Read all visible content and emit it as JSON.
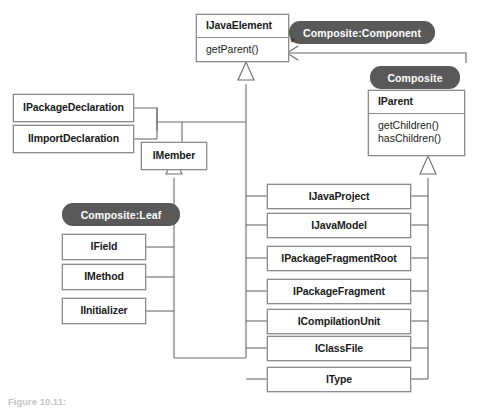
{
  "diagram": {
    "kind": "uml-class-diagram",
    "width": 488,
    "height": 408,
    "colors": {
      "badge_fill": "#595959",
      "badge_text": "#ffffff",
      "box_fill": "#ffffff",
      "box_border": "#8c8c8c",
      "line": "#6b6b6b",
      "text": "#1a1a1a",
      "background": "#ffffff"
    }
  },
  "classes": {
    "ijavaelement": {
      "name": "IJavaElement",
      "operations": "getParent()"
    },
    "iparent": {
      "name": "IParent",
      "operations_1": "getChildren()",
      "operations_2": "hasChildren()"
    },
    "ipackagedeclaration": {
      "name": "IPackageDeclaration"
    },
    "iimportdeclaration": {
      "name": "IImportDeclaration"
    },
    "imember": {
      "name": "IMember"
    },
    "ifield": {
      "name": "IField"
    },
    "imethod": {
      "name": "IMethod"
    },
    "iinitializer": {
      "name": "IInitializer"
    },
    "ijavaproject": {
      "name": "IJavaProject"
    },
    "ijavamodel": {
      "name": "IJavaModel"
    },
    "ipackagefragmentroot": {
      "name": "IPackageFragmentRoot"
    },
    "ipackagefragment": {
      "name": "IPackageFragment"
    },
    "icompilationunit": {
      "name": "ICompilationUnit"
    },
    "iclassfile": {
      "name": "IClassFile"
    },
    "itype": {
      "name": "IType"
    }
  },
  "badges": {
    "component": "Composite:Component",
    "composite": "Composite",
    "leaf": "Composite:Leaf"
  },
  "annotations": {
    "multiplicity_star": "*"
  },
  "caption": {
    "prefix": "Figure 10.11:",
    "text": "Figure 10.11:"
  }
}
